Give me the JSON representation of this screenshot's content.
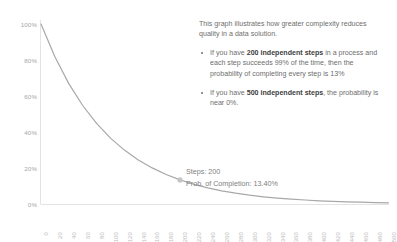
{
  "chart_data": {
    "type": "line",
    "title": "",
    "subtitle": "",
    "xlabel": "",
    "ylabel": "",
    "xlim": [
      0,
      500
    ],
    "ylim": [
      0,
      1.0
    ],
    "grid": false,
    "legend": "none",
    "series": [
      {
        "name": "Probability of Completion",
        "formula": "0.99^steps",
        "x": [
          0,
          20,
          40,
          60,
          80,
          100,
          120,
          140,
          160,
          180,
          200,
          220,
          240,
          260,
          280,
          300,
          320,
          340,
          360,
          380,
          400,
          420,
          440,
          460,
          480,
          500
        ],
        "values": [
          100.0,
          81.79,
          66.9,
          54.72,
          44.76,
          36.6,
          29.94,
          24.49,
          20.03,
          16.38,
          13.4,
          10.96,
          8.97,
          7.33,
          6.0,
          4.9,
          4.01,
          3.28,
          2.68,
          2.2,
          1.8,
          1.47,
          1.2,
          0.98,
          0.8,
          0.66
        ]
      }
    ],
    "x_tick_labels": [
      "0",
      "20",
      "40",
      "60",
      "80",
      "100",
      "120",
      "140",
      "160",
      "180",
      "200",
      "220",
      "240",
      "260",
      "280",
      "300",
      "320",
      "340",
      "360",
      "380",
      "400",
      "420",
      "440",
      "460",
      "480",
      "500"
    ],
    "y_tick_labels": [
      "100%",
      "80%",
      "60%",
      "40%",
      "20%",
      "0%"
    ],
    "y_tick_values": [
      100,
      80,
      60,
      40,
      20,
      0
    ],
    "marker": {
      "x": 200,
      "y": 13.4,
      "label_line_1": "Steps: 200",
      "label_line_2": "Prob. of Completion:  13.40%"
    },
    "line_color": "#a6a6a6",
    "marker_color": "#bfbfbf",
    "axis_color": "#d9d9d9"
  },
  "annotation": {
    "intro": "This graph illustrates how greater complexity reduces quality in a data solution.",
    "bullets": [
      {
        "pre": "If you have ",
        "bold": "200 independent steps",
        "post": " in a process and each step succeeds 99% of the time, then the probability of completing every step is 13%"
      },
      {
        "pre": "If you have ",
        "bold": "500 independent steps",
        "post": ", the probability is near 0%."
      }
    ]
  }
}
